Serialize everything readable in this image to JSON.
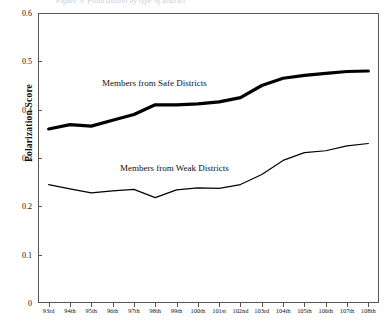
{
  "top_caption": "Figure 3. Polarization by type of district",
  "chart_data": {
    "type": "line",
    "title": "",
    "xlabel": "",
    "ylabel": "Polarization Score",
    "ylim": [
      0,
      0.6
    ],
    "ytick_values": [
      0,
      0.1,
      0.2,
      0.3,
      0.4,
      0.5,
      0.6
    ],
    "ytick_labels": [
      "0",
      "0.1",
      "0.2",
      "0.3",
      "0.4",
      "0.5",
      "0.6"
    ],
    "grid": false,
    "legend_position": "inline-annotation",
    "categories": [
      "93rd",
      "94th",
      "95th",
      "96th",
      "97th",
      "98th",
      "99th",
      "100th",
      "101st",
      "102nd",
      "103rd",
      "104th",
      "105th",
      "106th",
      "107th",
      "108th"
    ],
    "series": [
      {
        "name": "Members from Safe Districts",
        "color": "#000000",
        "line_width": 3.2,
        "values": [
          0.36,
          0.369,
          0.366,
          0.378,
          0.39,
          0.41,
          0.41,
          0.412,
          0.416,
          0.425,
          0.45,
          0.465,
          0.471,
          0.475,
          0.479,
          0.48
        ]
      },
      {
        "name": "Members from Weak Districts",
        "color": "#000000",
        "line_width": 1.2,
        "values": [
          0.245,
          0.236,
          0.228,
          0.232,
          0.235,
          0.218,
          0.234,
          0.238,
          0.237,
          0.245,
          0.266,
          0.295,
          0.311,
          0.315,
          0.325,
          0.33
        ]
      }
    ],
    "annotations": [
      {
        "text": "Members from Safe Districts",
        "near_series": "Members from Safe Districts"
      },
      {
        "text": "Members from Weak Districts",
        "near_series": "Members from Weak Districts"
      }
    ]
  }
}
